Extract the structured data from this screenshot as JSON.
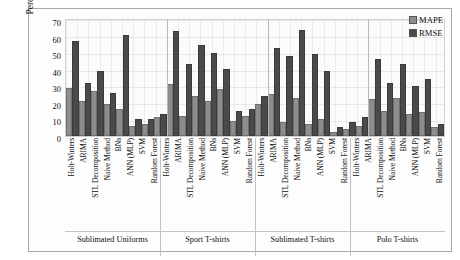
{
  "chart_data": {
    "type": "bar",
    "title": "",
    "xlabel": "",
    "ylabel": "Percentage error (%)",
    "ylim": [
      0,
      70
    ],
    "yticks": [
      70,
      60,
      50,
      40,
      30,
      20,
      10,
      0
    ],
    "grid": true,
    "legend_position": "top-right",
    "legend": [
      "MAPE",
      "RMSE"
    ],
    "colors": {
      "MAPE": "#8d8d8d",
      "RMSE": "#4a4a4a"
    },
    "categories": [
      "Holt-Winters",
      "ARIMA",
      "STL Decomposition",
      "Naive Method",
      "BNs",
      "ANN (MLP)",
      "SVM",
      "Random Forest"
    ],
    "groups": [
      {
        "name": "Sublimated Uniforms",
        "series": [
          {
            "name": "MAPE",
            "values": [
              28,
              20,
              26,
              18,
              15,
              5,
              6,
              10
            ]
          },
          {
            "name": "RMSE",
            "values": [
              56,
              31,
              38,
              25,
              60,
              9,
              9,
              12
            ]
          }
        ]
      },
      {
        "name": "Sport T-shirts",
        "series": [
          {
            "name": "MAPE",
            "values": [
              30,
              11,
              23,
              20,
              27,
              8,
              11,
              18
            ]
          },
          {
            "name": "RMSE",
            "values": [
              62,
              42,
              54,
              49,
              39,
              14,
              15,
              23
            ]
          }
        ]
      },
      {
        "name": "Sublimated T-shirts",
        "series": [
          {
            "name": "MAPE",
            "values": [
              24,
              7,
              22,
              6,
              9,
              1,
              3,
              5
            ]
          },
          {
            "name": "RMSE",
            "values": [
              52,
              47,
              63,
              48,
              38,
              4,
              7,
              10
            ]
          }
        ]
      },
      {
        "name": "Polo T-shirts",
        "series": [
          {
            "name": "MAPE",
            "values": [
              21,
              14,
              22,
              12,
              13,
              4,
              5,
              7
            ]
          },
          {
            "name": "RMSE",
            "values": [
              45,
              31,
              42,
              29,
              33,
              6,
              8,
              19
            ]
          }
        ]
      }
    ]
  },
  "legend": {
    "mape": "MAPE",
    "rmse": "RMSE"
  }
}
